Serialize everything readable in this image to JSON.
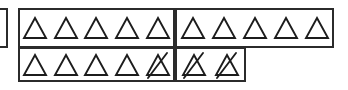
{
  "canvas": {
    "width": 348,
    "height": 90,
    "background": "#ffffff"
  },
  "ink_color": "#1c1c1c",
  "border_color": "#2b2b2b",
  "diagram": {
    "type": "counting-manipulative-triangles",
    "total_triangles": 17,
    "plain_triangles": 14,
    "crossed_triangles": 3,
    "partial_box_left_edge": {
      "label": "cut-off-box-fragment",
      "visible": true,
      "x": 0,
      "y": 8,
      "width": 8,
      "height": 40
    },
    "rows": [
      {
        "name": "top-row",
        "y": 8,
        "height": 40,
        "boxes": [
          {
            "name": "top-left-box",
            "x": 18,
            "width": 157,
            "count": 5,
            "triangles": [
              {
                "state": "plain"
              },
              {
                "state": "plain"
              },
              {
                "state": "plain"
              },
              {
                "state": "plain"
              },
              {
                "state": "plain"
              }
            ]
          },
          {
            "name": "top-right-box",
            "x": 175,
            "width": 159,
            "count": 5,
            "triangles": [
              {
                "state": "plain"
              },
              {
                "state": "plain"
              },
              {
                "state": "plain"
              },
              {
                "state": "plain"
              },
              {
                "state": "plain"
              }
            ]
          }
        ]
      },
      {
        "name": "bottom-row",
        "y": 47,
        "height": 35,
        "boxes": [
          {
            "name": "bottom-left-box",
            "x": 18,
            "width": 157,
            "count": 5,
            "triangles": [
              {
                "state": "plain"
              },
              {
                "state": "plain"
              },
              {
                "state": "plain"
              },
              {
                "state": "plain"
              },
              {
                "state": "crossed"
              }
            ]
          },
          {
            "name": "bottom-right-box",
            "x": 175,
            "width": 71,
            "count": 2,
            "triangles": [
              {
                "state": "crossed"
              },
              {
                "state": "crossed"
              }
            ]
          }
        ]
      }
    ]
  }
}
